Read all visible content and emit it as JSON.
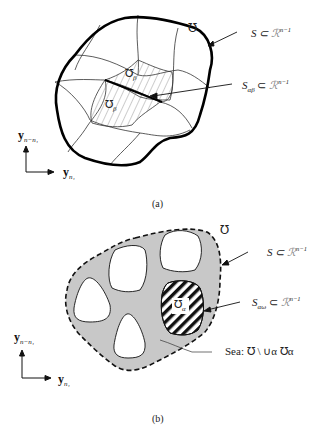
{
  "figure_a": {
    "caption": "(a)",
    "domain_label": "℧",
    "boundary_label": {
      "main": "S ⊂ ",
      "script": "ℛ",
      "sup": "n−1"
    },
    "interface_label": {
      "main": "S",
      "sub": "αβ",
      "rel": " ⊂ ",
      "script": "ℛ",
      "sup": "n−1"
    },
    "region_upper": {
      "symbol": "℧",
      "sub": "β"
    },
    "region_lower": {
      "symbol": "℧",
      "sub": "β"
    },
    "axis_vertical": {
      "main": "y",
      "sub": "n−n₁"
    },
    "axis_horizontal": {
      "main": "y",
      "sub": "n₁"
    }
  },
  "figure_b": {
    "caption": "(b)",
    "domain_label": "℧",
    "boundary_label": {
      "main": "S ⊂ ",
      "script": "ℛ",
      "sup": "n−1"
    },
    "interface_label": {
      "main": "S",
      "sub": "αω",
      "rel": " ⊂ ",
      "script": "ℛ",
      "sup": "n−1"
    },
    "island_label": {
      "symbol": "℧",
      "sub": "α"
    },
    "sea_label": "Sea: ℧ \\ ∪α ℧α",
    "axis_vertical": {
      "main": "y",
      "sub": "n−n₁"
    },
    "axis_horizontal": {
      "main": "y",
      "sub": "n₁"
    },
    "colors": {
      "sea_fill": "#c8c8c8",
      "island_fill": "#ffffff",
      "hatch": "#111111"
    }
  }
}
